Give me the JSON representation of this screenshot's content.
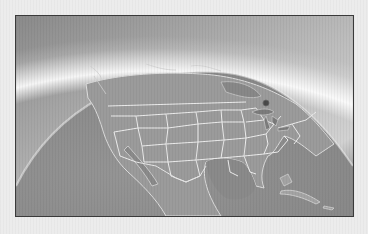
{
  "image": {
    "alt": "Grayscale 3D globe view of North America with US state borders, showing the curved horizon with atmospheric glow at the upper right and a marker dot near the Great Lakes region",
    "subject": "North America globe map",
    "frame_border_color": "#3a3a3a",
    "colors": {
      "ocean": "#8c8c8c",
      "land": "#9a9a9a",
      "borders": "#e8e8e8",
      "sky_dark": "#5a5a5a",
      "sky_light": "#f2f2f2",
      "marker": "#4a4a4a",
      "page_background": "#ececec"
    },
    "marker": {
      "icon": "location-dot-icon",
      "region": "Great Lakes / Michigan"
    }
  }
}
